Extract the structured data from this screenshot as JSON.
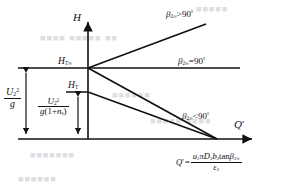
{
  "figure": {
    "type": "line-diagram",
    "axes": {
      "y_label": "H",
      "x_label": "Q'",
      "origin_px": [
        88,
        139
      ],
      "y_axis_top_px": [
        88,
        18
      ],
      "x_axis_right_px": [
        258,
        139
      ]
    },
    "curves": [
      {
        "name": "beta-gt-90",
        "label_main": "β",
        "label_sub": "2∞",
        "label_rel": ">90",
        "label_deg": "°",
        "from_px": [
          88,
          68
        ],
        "to_px": [
          205,
          24
        ]
      },
      {
        "name": "beta-eq-90",
        "label_main": "β",
        "label_sub": "2∞",
        "label_rel": "=90",
        "label_deg": "°",
        "from_px": [
          88,
          68
        ],
        "to_px": [
          239,
          68
        ]
      },
      {
        "name": "beta-lt-90",
        "label_main": "β",
        "label_sub": "2∞",
        "label_rel": "<90",
        "label_deg": "°",
        "from_px": [
          88,
          68
        ],
        "to_px": [
          216,
          139
        ]
      },
      {
        "name": "actual-head-line",
        "from_px": [
          88,
          92
        ],
        "to_px": [
          216,
          139
        ]
      }
    ],
    "level_lines": [
      {
        "name": "h-t-infinity-level",
        "from_px": [
          18,
          68
        ],
        "to_px": [
          88,
          68
        ]
      },
      {
        "name": "h-t-level",
        "from_px": [
          66,
          92
        ],
        "to_px": [
          88,
          92
        ]
      },
      {
        "name": "baseline-level",
        "from_px": [
          18,
          139
        ],
        "to_px": [
          88,
          139
        ]
      }
    ],
    "dimension_arrows": [
      {
        "name": "u2-squared-over-g-arrow",
        "x_px": 26,
        "from_y_px": 68,
        "to_y_px": 139
      },
      {
        "name": "u2-squared-over-g-1-plus-ns-arrow",
        "x_px": 78,
        "from_y_px": 92,
        "to_y_px": 139
      }
    ]
  },
  "labels": {
    "y_axis": "H",
    "x_axis_main": "Q",
    "x_axis_prime": "′",
    "h_t_infinity_main": "H",
    "h_t_infinity_sub": "T∞",
    "h_t_main": "H",
    "h_t_sub": "T"
  },
  "fraction_left": {
    "name": "u2-squared-over-g",
    "num_main": "U",
    "num_sub": "2",
    "num_sup": "2",
    "den": "g"
  },
  "fraction_mid": {
    "name": "u2-squared-over-g-times-one-plus-ns",
    "num_main": "U",
    "num_sub": "2",
    "num_sup": "2",
    "den_g": "g",
    "den_open": "(1+",
    "den_n": "n",
    "den_n_sub": "s",
    "den_close": ")"
  },
  "formula": {
    "lhs_main": "Q",
    "lhs_prime": "′",
    "equals": "=",
    "num_u": "u",
    "num_u_sub": "2",
    "num_pi": "π",
    "num_D": "D",
    "num_D_sub": "2",
    "num_b": "b",
    "num_b_sub": "2",
    "num_tan": "tan",
    "num_beta": "β",
    "num_beta_sub": "2∞",
    "den_eps": "ε",
    "den_eps_sub": "2"
  },
  "background_bleed": {
    "lines": [
      {
        "text": "■■■■■",
        "x_px": 196,
        "y_px": 8,
        "size_px": 9
      },
      {
        "text": "■■■■ ■■■■■ ■■",
        "x_px": 44,
        "y_px": 38,
        "size_px": 9
      },
      {
        "text": "■■■■■■",
        "x_px": 112,
        "y_px": 94,
        "size_px": 9
      },
      {
        "text": "■■■■■ ■■■■",
        "x_px": 150,
        "y_px": 120,
        "size_px": 9
      },
      {
        "text": "■■■■■■■",
        "x_px": 30,
        "y_px": 152,
        "size_px": 9
      },
      {
        "text": "■■■■■■",
        "x_px": 20,
        "y_px": 176,
        "size_px": 9
      }
    ]
  },
  "colors": {
    "ink": "#111111",
    "paper": "#ffffff",
    "bleed": "#b9bfc6"
  }
}
